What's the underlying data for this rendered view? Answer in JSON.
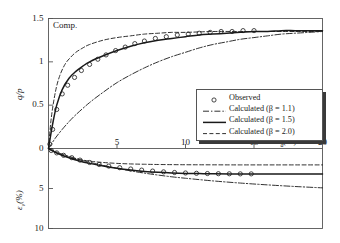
{
  "chart_data": {
    "type": "line",
    "title": "",
    "panel_note": "Comp.",
    "xlabel": "ε_d(%)",
    "xlabel_main": "ε",
    "xlabel_sub": "d",
    "xlabel_unit": "(%)",
    "xlim": [
      0,
      20
    ],
    "xticks": [
      0,
      5,
      10,
      15,
      20
    ],
    "xtick_labels": [
      "0",
      "5",
      "10",
      "15",
      "20"
    ],
    "grid": false,
    "legend_position": "center-right",
    "panels": [
      {
        "name": "upper",
        "ylabel": "q/p",
        "ylim": [
          0,
          1.5
        ],
        "yticks": [
          0,
          0.5,
          1,
          1.5
        ],
        "ytick_labels": [
          "0",
          "0.5",
          "1",
          "1.5"
        ],
        "inverted": false,
        "series": [
          {
            "name": "Observed",
            "style": "circles",
            "x": [
              0.1,
              0.3,
              0.6,
              1.0,
              1.4,
              1.9,
              2.4,
              3.0,
              3.6,
              4.2,
              4.9,
              5.6,
              6.3,
              7.0,
              7.8,
              8.6,
              9.4,
              10.2,
              11.0,
              11.8,
              12.6,
              13.4,
              14.2,
              15.0
            ],
            "y": [
              0.05,
              0.22,
              0.45,
              0.63,
              0.73,
              0.82,
              0.9,
              0.97,
              1.03,
              1.08,
              1.13,
              1.17,
              1.21,
              1.24,
              1.27,
              1.29,
              1.31,
              1.32,
              1.33,
              1.34,
              1.35,
              1.35,
              1.36,
              1.36
            ]
          },
          {
            "name": "Calculated (β = 1.1)",
            "style": "dashdot",
            "x": [
              0,
              0.5,
              1,
              1.5,
              2,
              3,
              4,
              5,
              6,
              7,
              8,
              9,
              10,
              11,
              12,
              13,
              14,
              15,
              16,
              17,
              18,
              19,
              20
            ],
            "y": [
              0,
              0.12,
              0.22,
              0.31,
              0.39,
              0.53,
              0.65,
              0.76,
              0.85,
              0.93,
              1.0,
              1.06,
              1.11,
              1.16,
              1.2,
              1.23,
              1.26,
              1.28,
              1.3,
              1.32,
              1.33,
              1.34,
              1.35
            ]
          },
          {
            "name": "Calculated (β = 1.5)",
            "style": "solid",
            "x": [
              0,
              0.3,
              0.6,
              1,
              1.5,
              2,
              2.5,
              3,
              4,
              5,
              6,
              7,
              8,
              9,
              10,
              11,
              12,
              13,
              14,
              15,
              16,
              17,
              18,
              19,
              20
            ],
            "y": [
              0,
              0.28,
              0.5,
              0.68,
              0.81,
              0.89,
              0.95,
              1.0,
              1.07,
              1.13,
              1.18,
              1.22,
              1.25,
              1.27,
              1.29,
              1.31,
              1.32,
              1.33,
              1.34,
              1.35,
              1.35,
              1.36,
              1.36,
              1.36,
              1.36
            ]
          },
          {
            "name": "Calculated (β = 2.0)",
            "style": "dashed",
            "x": [
              0,
              0.2,
              0.5,
              0.8,
              1.2,
              1.6,
              2,
              2.5,
              3,
              4,
              5,
              6,
              7,
              8,
              9,
              10,
              12,
              14,
              16,
              18,
              20
            ],
            "y": [
              0,
              0.35,
              0.65,
              0.83,
              0.97,
              1.05,
              1.11,
              1.16,
              1.2,
              1.25,
              1.28,
              1.3,
              1.32,
              1.33,
              1.34,
              1.34,
              1.35,
              1.35,
              1.35,
              1.35,
              1.35
            ]
          }
        ]
      },
      {
        "name": "lower",
        "ylabel": "ε_v(%)",
        "ylabel_main": "ε",
        "ylabel_sub": "v",
        "ylabel_unit": "(%)",
        "ylim": [
          0,
          10
        ],
        "yticks": [
          0,
          5,
          10
        ],
        "ytick_labels": [
          "0",
          "5",
          "10"
        ],
        "inverted": true,
        "series": [
          {
            "name": "Observed",
            "style": "circles",
            "x": [
              0.2,
              0.6,
              1.1,
              1.7,
              2.3,
              3.0,
              3.7,
              4.4,
              5.2,
              6.0,
              6.8,
              7.6,
              8.4,
              9.2,
              10.0,
              10.8,
              11.6,
              12.4,
              13.2,
              14.0,
              14.8
            ],
            "y": [
              0.25,
              0.55,
              0.85,
              1.15,
              1.45,
              1.75,
              2.0,
              2.2,
              2.4,
              2.56,
              2.7,
              2.82,
              2.92,
              3.0,
              3.06,
              3.1,
              3.13,
              3.15,
              3.16,
              3.17,
              3.17
            ]
          },
          {
            "name": "Calculated (β = 1.1)",
            "style": "dashdot",
            "x": [
              0,
              0.5,
              1,
              2,
              3,
              4,
              5,
              6,
              7,
              8,
              9,
              10,
              12,
              14,
              16,
              18,
              20
            ],
            "y": [
              0,
              0.38,
              0.7,
              1.25,
              1.72,
              2.12,
              2.48,
              2.8,
              3.08,
              3.32,
              3.54,
              3.72,
              4.05,
              4.32,
              4.55,
              4.75,
              4.92
            ]
          },
          {
            "name": "Calculated (β = 1.5)",
            "style": "solid",
            "x": [
              0,
              0.4,
              0.9,
              1.5,
              2.2,
              3,
              4,
              5,
              6,
              7,
              8,
              9,
              10,
              11,
              12,
              14,
              16,
              18,
              20
            ],
            "y": [
              0,
              0.4,
              0.78,
              1.15,
              1.52,
              1.86,
              2.2,
              2.48,
              2.7,
              2.86,
              2.98,
              3.06,
              3.11,
              3.14,
              3.16,
              3.18,
              3.18,
              3.18,
              3.18
            ]
          },
          {
            "name": "Calculated (β = 2.0)",
            "style": "dashed",
            "x": [
              0,
              0.3,
              0.7,
              1.2,
              1.8,
              2.5,
              3.2,
              4,
              5,
              6,
              7,
              8,
              10,
              12,
              14,
              16,
              18,
              20
            ],
            "y": [
              0,
              0.35,
              0.65,
              0.95,
              1.22,
              1.45,
              1.62,
              1.75,
              1.86,
              1.93,
              1.97,
              2.0,
              2.03,
              2.04,
              2.05,
              2.05,
              2.05,
              2.05
            ]
          }
        ]
      }
    ],
    "legend": {
      "entries": [
        {
          "label": "Observed",
          "style": "circles"
        },
        {
          "label": "Calculated (β = 1.1)",
          "style": "dashdot"
        },
        {
          "label": "Calculated (β = 1.5)",
          "style": "solid"
        },
        {
          "label": "Calculated (β = 2.0)",
          "style": "dashed"
        }
      ]
    },
    "colors": {
      "line": "#1a1a1a",
      "axis": "#555555",
      "background": "#ffffff"
    }
  }
}
